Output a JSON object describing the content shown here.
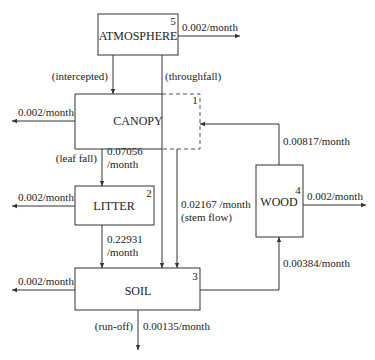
{
  "diagram": {
    "compartments": [
      {
        "id": 5,
        "name": "ATMOSPHERE"
      },
      {
        "id": 1,
        "name": "CANOPY"
      },
      {
        "id": 2,
        "name": "LITTER"
      },
      {
        "id": 3,
        "name": "SOIL"
      },
      {
        "id": 4,
        "name": "WOOD"
      }
    ],
    "flows": {
      "atmosphere_out": "0.002/month",
      "intercepted": "(intercepted)",
      "throughfall": "(throughfall)",
      "canopy_out": "0.002/month",
      "leaf_fall_label": "(leaf fall)",
      "leaf_fall_rate_1": "0.07056",
      "leaf_fall_rate_2": "/month",
      "litter_out": "0.002/month",
      "litter_soil_rate_1": "0.22931",
      "litter_soil_rate_2": "/month",
      "stem_flow_rate": "0.02167 /month",
      "stem_flow_label": "(stem flow)",
      "wood_canopy": "0.00817/month",
      "wood_out": "0.002/month",
      "soil_wood": "0.00384/month",
      "soil_out": "0.002/month",
      "run_off_label": "(run-off)",
      "run_off_rate": "0.00135/month"
    }
  }
}
